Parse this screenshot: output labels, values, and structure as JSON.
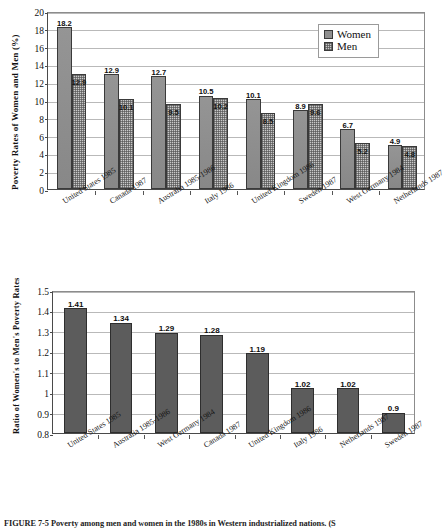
{
  "figure": {
    "caption_label": "FIGURE 7-5",
    "caption_text": "Poverty among men and women in the 1980s in Western industrialized nations. (S"
  },
  "chart_data": [
    {
      "type": "bar",
      "id": "poverty-rates",
      "title": "",
      "xlabel": "",
      "ylabel": "Poverty Rates of Women and Men (%)",
      "ylim": [
        0,
        20
      ],
      "ytick_step": 2,
      "yticks": [
        "0",
        "2",
        "4",
        "6",
        "8",
        "10",
        "12",
        "14",
        "16",
        "18",
        "20"
      ],
      "grid": true,
      "legend_position": "top-right",
      "categories": [
        "United States 1985",
        "Canada 1987",
        "Australia 1985-1986",
        "Italy 1986",
        "United Kingdom 1986",
        "Sweden 1987",
        "West Germany 1984",
        "Netherlands 1987"
      ],
      "series": [
        {
          "name": "Women",
          "values": [
            18.2,
            12.9,
            12.7,
            10.5,
            10.1,
            8.9,
            6.7,
            4.9
          ],
          "labels": [
            "18.2",
            "12.9",
            "12.7",
            "10.5",
            "10.1",
            "8.9",
            "6.7",
            "4.9"
          ],
          "color": "#8f8f8f"
        },
        {
          "name": "Men",
          "values": [
            12.9,
            10.1,
            9.5,
            10.2,
            8.5,
            9.6,
            5.2,
            4.8
          ],
          "labels": [
            "12.9",
            "10.1",
            "9.5",
            "10.2",
            "8.5",
            "9.6",
            "5.2",
            "4.8"
          ],
          "color": "#c9c9c9"
        }
      ]
    },
    {
      "type": "bar",
      "id": "poverty-ratio",
      "title": "",
      "xlabel": "",
      "ylabel": "Ratio of Women's to Men's Poverty Rates",
      "ylim": [
        0.8,
        1.5
      ],
      "ytick_step": 0.1,
      "yticks": [
        "0.8",
        "0.9",
        "1",
        "1.1",
        "1.2",
        "1.3",
        "1.4",
        "1.5"
      ],
      "grid": true,
      "categories": [
        "United States 1985",
        "Australia 1985-1986",
        "West Germany 1984",
        "Canada 1987",
        "United Kingdom 1986",
        "Italy 1986",
        "Netherlands 1987",
        "Sweden 1987"
      ],
      "series": [
        {
          "name": "Ratio",
          "values": [
            1.41,
            1.34,
            1.29,
            1.28,
            1.19,
            1.02,
            1.02,
            0.9
          ],
          "labels": [
            "1.41",
            "1.34",
            "1.29",
            "1.28",
            "1.19",
            "1.02",
            "1.02",
            "0.9"
          ],
          "color": "#5c5c5c"
        }
      ]
    }
  ]
}
